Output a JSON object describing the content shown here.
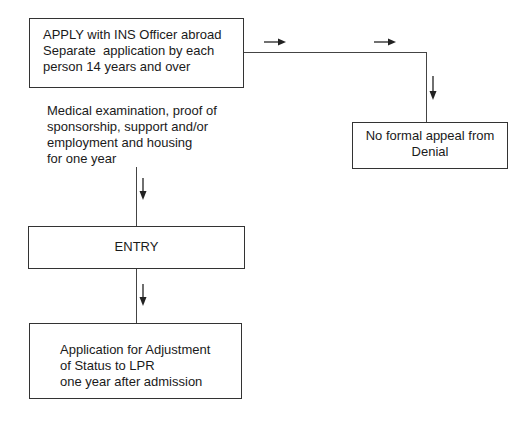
{
  "diagram": {
    "nodes": {
      "apply": {
        "lines": [
          "APPLY with INS Officer abroad",
          "Separate  application by each",
          "person 14 years and over"
        ]
      },
      "requirements": {
        "lines": [
          "Medical examination, proof of",
          "sponsorship, support and/or",
          "employment and housing",
          "for one year"
        ]
      },
      "entry": {
        "label": "ENTRY"
      },
      "adjustment": {
        "lines": [
          "Application for Adjustment",
          "of Status to LPR",
          "one year after admission"
        ]
      },
      "denial": {
        "lines": [
          "No formal appeal from",
          "Denial"
        ]
      }
    },
    "edges": [
      {
        "from": "apply",
        "to": "denial",
        "direction": "right-then-down"
      },
      {
        "from": "apply",
        "to": "entry",
        "direction": "down",
        "via": "requirements"
      },
      {
        "from": "entry",
        "to": "adjustment",
        "direction": "down"
      }
    ],
    "colors": {
      "stroke": "#333333",
      "text": "#1a1a1a",
      "background": "#ffffff"
    }
  }
}
